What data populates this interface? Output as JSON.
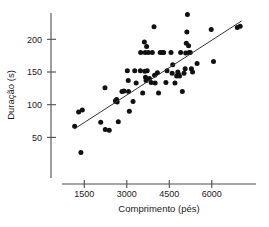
{
  "chart_data": {
    "type": "scatter",
    "title": "",
    "xlabel": "Comprimento (pés)",
    "ylabel": "Duração (s)",
    "xticks": [
      1500,
      3000,
      4500,
      6000
    ],
    "yticks": [
      50,
      100,
      150,
      200
    ],
    "xtick_labels": [
      "1500",
      "3000",
      "4500",
      "6000"
    ],
    "ytick_labels": [
      "50",
      "100",
      "150",
      "200"
    ],
    "xlim": [
      900,
      7200
    ],
    "ylim": [
      15,
      250
    ],
    "grid": false,
    "legend": null,
    "marker": "filled-circle",
    "marker_color": "#111111",
    "trendline": {
      "type": "linear",
      "color": "#333333",
      "x_start": 1150,
      "y_start": 63,
      "x_end": 7050,
      "y_end": 228
    },
    "points": [
      {
        "x": 1160,
        "y": 67
      },
      {
        "x": 1300,
        "y": 89
      },
      {
        "x": 1380,
        "y": 27
      },
      {
        "x": 1430,
        "y": 92
      },
      {
        "x": 2080,
        "y": 73
      },
      {
        "x": 2230,
        "y": 126
      },
      {
        "x": 2240,
        "y": 62
      },
      {
        "x": 2380,
        "y": 61
      },
      {
        "x": 2600,
        "y": 106
      },
      {
        "x": 2620,
        "y": 105
      },
      {
        "x": 2640,
        "y": 108
      },
      {
        "x": 2660,
        "y": 104
      },
      {
        "x": 2700,
        "y": 74
      },
      {
        "x": 2830,
        "y": 120
      },
      {
        "x": 2900,
        "y": 121
      },
      {
        "x": 3020,
        "y": 152
      },
      {
        "x": 3050,
        "y": 137
      },
      {
        "x": 3060,
        "y": 120
      },
      {
        "x": 3090,
        "y": 90
      },
      {
        "x": 3220,
        "y": 105
      },
      {
        "x": 3280,
        "y": 152
      },
      {
        "x": 3330,
        "y": 133
      },
      {
        "x": 3480,
        "y": 152
      },
      {
        "x": 3490,
        "y": 180
      },
      {
        "x": 3560,
        "y": 118
      },
      {
        "x": 3620,
        "y": 196
      },
      {
        "x": 3640,
        "y": 151
      },
      {
        "x": 3650,
        "y": 180
      },
      {
        "x": 3660,
        "y": 142
      },
      {
        "x": 3680,
        "y": 137
      },
      {
        "x": 3700,
        "y": 189
      },
      {
        "x": 3720,
        "y": 152
      },
      {
        "x": 3760,
        "y": 180
      },
      {
        "x": 3800,
        "y": 140
      },
      {
        "x": 3860,
        "y": 134
      },
      {
        "x": 3900,
        "y": 180
      },
      {
        "x": 3960,
        "y": 219
      },
      {
        "x": 3980,
        "y": 145
      },
      {
        "x": 4000,
        "y": 133
      },
      {
        "x": 4080,
        "y": 149
      },
      {
        "x": 4120,
        "y": 118
      },
      {
        "x": 4180,
        "y": 180
      },
      {
        "x": 4260,
        "y": 180
      },
      {
        "x": 4300,
        "y": 180
      },
      {
        "x": 4380,
        "y": 134
      },
      {
        "x": 4420,
        "y": 152
      },
      {
        "x": 4560,
        "y": 180
      },
      {
        "x": 4600,
        "y": 148
      },
      {
        "x": 4620,
        "y": 161
      },
      {
        "x": 4700,
        "y": 133
      },
      {
        "x": 4760,
        "y": 144
      },
      {
        "x": 4800,
        "y": 150
      },
      {
        "x": 4820,
        "y": 147
      },
      {
        "x": 4860,
        "y": 144
      },
      {
        "x": 4900,
        "y": 180
      },
      {
        "x": 4960,
        "y": 120
      },
      {
        "x": 5020,
        "y": 148
      },
      {
        "x": 5060,
        "y": 155
      },
      {
        "x": 5080,
        "y": 179
      },
      {
        "x": 5100,
        "y": 194
      },
      {
        "x": 5120,
        "y": 211
      },
      {
        "x": 5140,
        "y": 238
      },
      {
        "x": 5180,
        "y": 190
      },
      {
        "x": 5200,
        "y": 180
      },
      {
        "x": 5240,
        "y": 180
      },
      {
        "x": 5280,
        "y": 155
      },
      {
        "x": 5320,
        "y": 150
      },
      {
        "x": 5480,
        "y": 163
      },
      {
        "x": 5980,
        "y": 215
      },
      {
        "x": 6060,
        "y": 166
      },
      {
        "x": 6900,
        "y": 218
      },
      {
        "x": 7000,
        "y": 220
      }
    ]
  }
}
